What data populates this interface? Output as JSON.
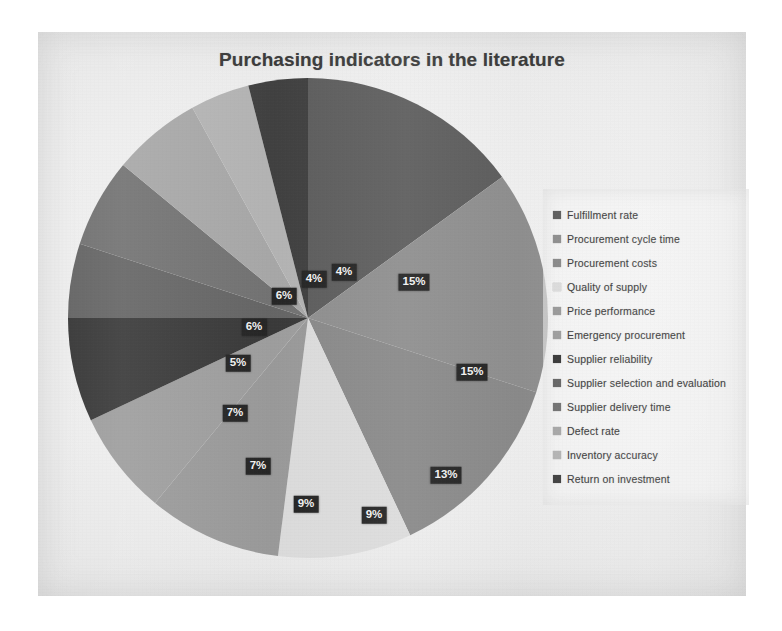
{
  "chart_data": {
    "type": "pie",
    "title": "Purchasing indicators in the literature",
    "subtitle": "",
    "xlabel": "",
    "ylabel": "",
    "legend_position": "right",
    "grid": false,
    "value_unit": "%",
    "start_angle_deg": 0,
    "direction": "clockwise",
    "categories": [
      "Fulfillment rate",
      "Procurement cycle time",
      "Procurement costs",
      "Quality of supply",
      "Price performance",
      "Emergency procurement",
      "Supplier reliability",
      "Supplier selection and evaluation",
      "Supplier delivery time",
      "Defect rate",
      "Inventory accuracy",
      "Return on investment"
    ],
    "values": [
      15,
      15,
      13,
      9,
      9,
      7,
      7,
      5,
      6,
      6,
      4,
      4
    ],
    "labels": [
      "15%",
      "15%",
      "13%",
      "9%",
      "9%",
      "7%",
      "7%",
      "5%",
      "6%",
      "6%",
      "4%",
      "4%"
    ],
    "colors": [
      "#5e5e5e",
      "#8f8f8f",
      "#8a8a8a",
      "#dcdcdc",
      "#9a9a9a",
      "#9e9e9e",
      "#3a3a3a",
      "#666666",
      "#737373",
      "#a8a8a8",
      "#b4b4b4",
      "#414141"
    ]
  },
  "chart": {
    "title": "Purchasing indicators in the literature",
    "slices": [
      {
        "label": "Fulfillment rate",
        "value": 15,
        "display": "15%",
        "color": "#5e5e5e",
        "label_x": 354,
        "label_y": 226
      },
      {
        "label": "Procurement cycle time",
        "value": 15,
        "display": "15%",
        "color": "#8f8f8f",
        "label_x": 412,
        "label_y": 316
      },
      {
        "label": "Procurement costs",
        "value": 13,
        "display": "13%",
        "color": "#8a8a8a",
        "label_x": 386,
        "label_y": 419
      },
      {
        "label": "Quality of supply",
        "value": 9,
        "display": "9%",
        "color": "#dcdcdc",
        "label_x": 314,
        "label_y": 459
      },
      {
        "label": "Price performance",
        "value": 9,
        "display": "9%",
        "color": "#9a9a9a",
        "label_x": 246,
        "label_y": 448
      },
      {
        "label": "Emergency procurement",
        "value": 7,
        "display": "7%",
        "color": "#9e9e9e",
        "label_x": 198,
        "label_y": 410
      },
      {
        "label": "Supplier reliability",
        "value": 7,
        "display": "7%",
        "color": "#3a3a3a",
        "label_x": 175,
        "label_y": 357
      },
      {
        "label": "Supplier selection and evaluation",
        "value": 5,
        "display": "5%",
        "color": "#666666",
        "label_x": 178,
        "label_y": 307
      },
      {
        "label": "Supplier delivery time",
        "value": 6,
        "display": "6%",
        "color": "#737373",
        "label_x": 194,
        "label_y": 271
      },
      {
        "label": "Defect rate",
        "value": 6,
        "display": "6%",
        "color": "#a8a8a8",
        "label_x": 224,
        "label_y": 240
      },
      {
        "label": "Inventory accuracy",
        "value": 4,
        "display": "4%",
        "color": "#b4b4b4",
        "label_x": 254,
        "label_y": 223
      },
      {
        "label": "Return on investment",
        "value": 4,
        "display": "4%",
        "color": "#414141",
        "label_x": 284,
        "label_y": 216
      }
    ]
  },
  "legend": {
    "items": [
      {
        "label": "Fulfillment rate",
        "color": "#5e5e5e"
      },
      {
        "label": "Procurement cycle time",
        "color": "#8f8f8f"
      },
      {
        "label": "Procurement costs",
        "color": "#8a8a8a"
      },
      {
        "label": "Quality of supply",
        "color": "#dcdcdc"
      },
      {
        "label": "Price performance",
        "color": "#9a9a9a"
      },
      {
        "label": "Emergency procurement",
        "color": "#9e9e9e"
      },
      {
        "label": "Supplier reliability",
        "color": "#3a3a3a"
      },
      {
        "label": "Supplier selection and evaluation",
        "color": "#666666"
      },
      {
        "label": "Supplier delivery time",
        "color": "#737373"
      },
      {
        "label": "Defect rate",
        "color": "#a8a8a8"
      },
      {
        "label": "Inventory accuracy",
        "color": "#b4b4b4"
      },
      {
        "label": "Return on investment",
        "color": "#414141"
      }
    ]
  }
}
